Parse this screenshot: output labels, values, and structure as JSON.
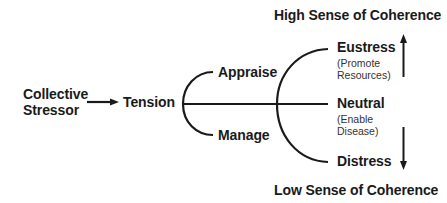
{
  "diagram": {
    "header_top": "High Sense of Coherence",
    "header_bottom": "Low Sense of Coherence",
    "nodes": {
      "collective_stressor": {
        "line1": "Collective",
        "line2": "Stressor"
      },
      "tension": "Tension",
      "appraise": "Appraise",
      "manage": "Manage",
      "eustress": {
        "label": "Eustress",
        "sub1": "(Promote",
        "sub2": "Resources)"
      },
      "neutral": {
        "label": "Neutral",
        "sub1": "(Enable",
        "sub2": "Disease)"
      },
      "distress": {
        "label": "Distress"
      }
    },
    "colors": {
      "stroke": "#1a1a1a",
      "text": "#1a1a1a",
      "background": "#ffffff"
    }
  }
}
